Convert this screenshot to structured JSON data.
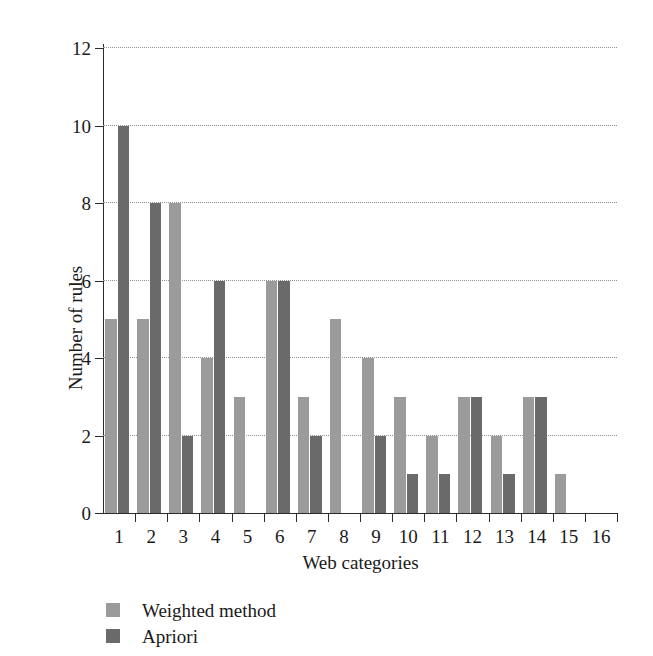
{
  "chart_data": {
    "type": "bar",
    "title": "",
    "xlabel": "Web categories",
    "ylabel": "Number of rules",
    "categories": [
      "1",
      "2",
      "3",
      "4",
      "5",
      "6",
      "7",
      "8",
      "9",
      "10",
      "11",
      "12",
      "13",
      "14",
      "15",
      "16"
    ],
    "series": [
      {
        "name": "Weighted method",
        "color": "#9b9b9b",
        "values": [
          5,
          5,
          8,
          4,
          3,
          6,
          3,
          5,
          4,
          3,
          2,
          3,
          2,
          3,
          1,
          0
        ]
      },
      {
        "name": "Apriori",
        "color": "#6a6a6a",
        "values": [
          10,
          8,
          2,
          6,
          0,
          6,
          2,
          0,
          2,
          1,
          1,
          3,
          1,
          3,
          0,
          0
        ]
      }
    ],
    "ylim": [
      0,
      12
    ],
    "yticks": [
      0,
      2,
      4,
      6,
      8,
      10,
      12
    ],
    "ytick_labels": [
      "0",
      "2",
      "4",
      "6",
      "8",
      "10",
      "12"
    ],
    "xtick_labels": [
      "1",
      "2",
      "3",
      "4",
      "5",
      "6",
      "7",
      "8",
      "9",
      "10",
      "11",
      "12",
      "13",
      "14",
      "15",
      "16"
    ],
    "grid": "horizontal-dotted",
    "legend_position": "below-left",
    "background": "#ffffff",
    "axis_color": "#2b2b2b",
    "grid_color": "#8f8f8f"
  },
  "legend": {
    "entries": [
      {
        "label": "Weighted method",
        "color": "#9b9b9b"
      },
      {
        "label": "Apriori",
        "color": "#6a6a6a"
      }
    ]
  }
}
